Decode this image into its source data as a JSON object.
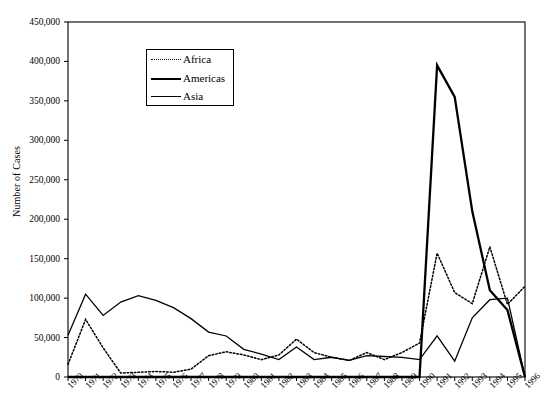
{
  "chart_data": {
    "type": "line",
    "title": "",
    "xlabel": "",
    "ylabel": "Number of Cases",
    "ylim": [
      0,
      450000
    ],
    "ytick_values": [
      0,
      50000,
      100000,
      150000,
      200000,
      250000,
      300000,
      350000,
      400000,
      450000
    ],
    "ytick_labels": [
      "0",
      "50,000",
      "100,000",
      "150,000",
      "200,000",
      "250,000",
      "300,000",
      "350,000",
      "400,000",
      "450,000"
    ],
    "grid": false,
    "legend_position": "upper-left-inside",
    "x": [
      1970,
      1971,
      1972,
      1973,
      1974,
      1975,
      1976,
      1977,
      1978,
      1979,
      1980,
      1981,
      1982,
      1983,
      1984,
      1985,
      1986,
      1987,
      1988,
      1989,
      1990,
      1991,
      1992,
      1993,
      1994,
      1995,
      1996
    ],
    "categories": [
      "1970",
      "1971",
      "1972",
      "1973",
      "1974",
      "1975",
      "1976",
      "1977",
      "1978",
      "1979",
      "1980",
      "1981",
      "1982",
      "1983",
      "1984",
      "1985",
      "1986",
      "1987",
      "1988",
      "1989",
      "1990",
      "1991",
      "1992",
      "1993",
      "1994",
      "1995",
      "1996"
    ],
    "series": [
      {
        "name": "Africa",
        "style": "dotted",
        "values": [
          16000,
          73000,
          37000,
          5000,
          6000,
          7000,
          6000,
          10000,
          27000,
          32000,
          28000,
          22000,
          28000,
          48000,
          31000,
          25000,
          21000,
          31000,
          22000,
          31000,
          43000,
          157000,
          107000,
          93000,
          165000,
          92000,
          115000
        ]
      },
      {
        "name": "Americas",
        "style": "thick-solid",
        "values": [
          0,
          0,
          0,
          0,
          0,
          0,
          0,
          0,
          0,
          0,
          0,
          0,
          0,
          0,
          0,
          0,
          0,
          0,
          0,
          0,
          0,
          395000,
          355000,
          210000,
          110000,
          85000,
          0
        ]
      },
      {
        "name": "Asia",
        "style": "thin-solid",
        "values": [
          53000,
          105000,
          78000,
          95000,
          103000,
          97000,
          88000,
          74000,
          57000,
          52000,
          35000,
          29000,
          22000,
          38000,
          22000,
          25000,
          21000,
          27000,
          26000,
          25000,
          22000,
          52000,
          20000,
          75000,
          98000,
          100000,
          0
        ]
      }
    ]
  },
  "legend": {
    "items": [
      {
        "label": "Africa",
        "style": "dotted"
      },
      {
        "label": "Americas",
        "style": "thick-solid"
      },
      {
        "label": "Asia",
        "style": "thin-solid"
      }
    ]
  },
  "colors": {
    "line": "#000000",
    "axis": "#000000",
    "background": "#ffffff"
  }
}
